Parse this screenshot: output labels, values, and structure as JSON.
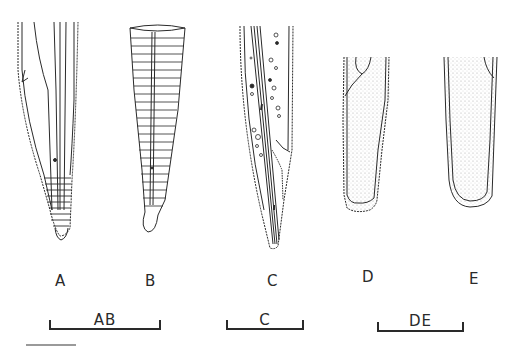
{
  "figure": {
    "panels": [
      {
        "id": "A",
        "label": "A",
        "description": "tail with annulated tip and central canal"
      },
      {
        "id": "B",
        "label": "B",
        "description": "annulated conical tail"
      },
      {
        "id": "C",
        "label": "C",
        "description": "tail with granular inclusions"
      },
      {
        "id": "D",
        "label": "D",
        "description": "blunt stippled tail tip"
      },
      {
        "id": "E",
        "label": "E",
        "description": "rounded stippled tail tip"
      }
    ],
    "scale_bars": [
      {
        "id": "AB",
        "label": "AB"
      },
      {
        "id": "C",
        "label": "C"
      },
      {
        "id": "DE",
        "label": "DE"
      }
    ],
    "colors": {
      "ink": "#2a2a2a",
      "stipple": "#b8b8b8",
      "background": "#ffffff"
    }
  }
}
